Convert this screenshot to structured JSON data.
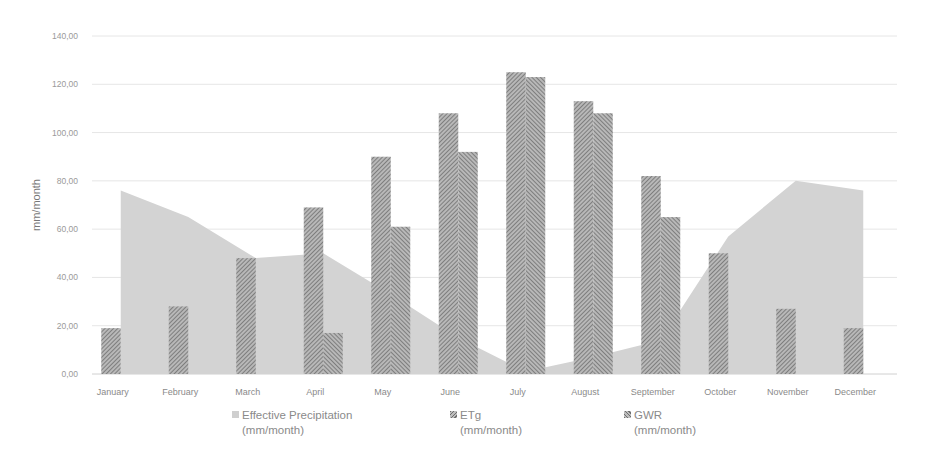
{
  "chart_data": {
    "type": "bar+area",
    "title": "",
    "xlabel": "",
    "ylabel": "mm/month",
    "ylim": [
      0,
      140
    ],
    "yticks": [
      "0,00",
      "20,00",
      "40,00",
      "60,00",
      "80,00",
      "100,00",
      "120,00",
      "140,00"
    ],
    "grid": true,
    "legend_position": "bottom",
    "categories": [
      "January",
      "February",
      "March",
      "April",
      "May",
      "June",
      "July",
      "August",
      "September",
      "October",
      "November",
      "December"
    ],
    "series": [
      {
        "name": "Effective Precipitation (mm/month)",
        "type": "area",
        "values": [
          76,
          65,
          48,
          50,
          33,
          15,
          1,
          7,
          14,
          57,
          80,
          76
        ]
      },
      {
        "name": "ETg (mm/month)",
        "type": "bar",
        "values": [
          19,
          28,
          48,
          69,
          90,
          108,
          125,
          113,
          82,
          50,
          27,
          19
        ]
      },
      {
        "name": "GWR (mm/month)",
        "type": "bar",
        "values": [
          0,
          0,
          0,
          17,
          61,
          92,
          123,
          108,
          65,
          0,
          0,
          0
        ]
      }
    ]
  },
  "legend": {
    "items": [
      {
        "line1": "Effective Precipitation",
        "line2": "(mm/month)"
      },
      {
        "line1": "ETg",
        "line2": "(mm/month)"
      },
      {
        "line1": "GWR",
        "line2": "(mm/month)"
      }
    ]
  }
}
